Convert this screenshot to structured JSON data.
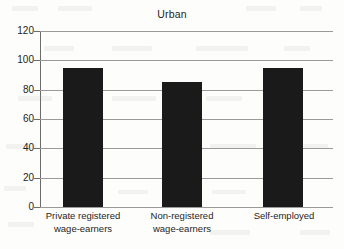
{
  "chart_data": {
    "type": "bar",
    "title": "Urban",
    "xlabel": "",
    "ylabel": "",
    "categories": [
      "Private registered wage-earners",
      "Non-registered wage-earners",
      "Self-employed"
    ],
    "category_lines": [
      [
        "Private registered",
        "wage-earners"
      ],
      [
        "Non-registered",
        "wage-earners"
      ],
      [
        "Self-employed",
        ""
      ]
    ],
    "values": [
      95,
      85,
      95
    ],
    "ylim": [
      0,
      120
    ],
    "yticks": [
      0,
      20,
      40,
      60,
      80,
      100,
      120
    ],
    "ytick_labels": [
      "0",
      "20",
      "40",
      "60",
      "80",
      "100",
      "120"
    ],
    "grid": true,
    "legend": false,
    "bar_color": "#1a1a1a",
    "grid_color": "#9a9a9a",
    "axis_color": "#6d6d6d",
    "background_color": "#fdfdfc"
  }
}
